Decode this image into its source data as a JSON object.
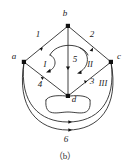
{
  "figure": {
    "caption": "（b）",
    "vertices": [
      {
        "id": "a",
        "label": "a",
        "x": 24,
        "y": 62,
        "label_x": 14,
        "label_y": 59
      },
      {
        "id": "b",
        "label": "b",
        "x": 68,
        "y": 26,
        "label_x": 65,
        "label_y": 16
      },
      {
        "id": "c",
        "label": "c",
        "x": 111,
        "y": 62,
        "label_x": 117,
        "label_y": 59
      },
      {
        "id": "d",
        "label": "d",
        "x": 68,
        "y": 96,
        "label_x": 72,
        "label_y": 102
      }
    ],
    "edges": [
      {
        "id": "1",
        "label": "1",
        "from": "a",
        "to": "b",
        "label_x": 38,
        "label_y": 37
      },
      {
        "id": "2",
        "label": "2",
        "from": "b",
        "to": "c",
        "label_x": 91,
        "label_y": 37
      },
      {
        "id": "3",
        "label": "3",
        "from": "d",
        "to": "c",
        "label_x": 92,
        "label_y": 83
      },
      {
        "id": "4",
        "label": "4",
        "from": "a",
        "to": "d",
        "label_x": 40,
        "label_y": 85
      },
      {
        "id": "5",
        "label": "5",
        "from": "b",
        "to": "d",
        "label_x": 74,
        "label_y": 60
      },
      {
        "id": "6",
        "label": "6",
        "from": "a",
        "to": "c",
        "label_x": 66,
        "label_y": 138
      }
    ],
    "faces": [
      {
        "id": "I",
        "label": "I",
        "label_x": 45,
        "label_y": 64
      },
      {
        "id": "II",
        "label": "II",
        "label_x": 89,
        "label_y": 64
      },
      {
        "id": "III",
        "label": "III",
        "label_x": 101,
        "label_y": 84
      }
    ],
    "colors": {
      "stroke": "#2b2b2b",
      "vertex": "#111111",
      "text": "#1a1a1a",
      "background": "#ffffff"
    }
  }
}
